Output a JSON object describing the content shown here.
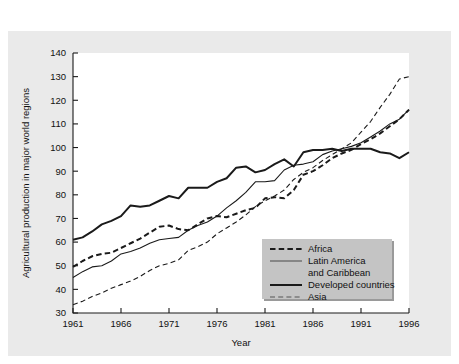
{
  "chart_data": {
    "type": "line",
    "title": "",
    "xlabel": "Year",
    "ylabel": "Agricultural production in major world regions",
    "xlim": [
      1961,
      1996
    ],
    "ylim": [
      30,
      140
    ],
    "xticks": [
      1961,
      1966,
      1971,
      1976,
      1981,
      1986,
      1991,
      1996
    ],
    "yticks": [
      30,
      40,
      50,
      60,
      70,
      80,
      90,
      100,
      110,
      120,
      130,
      140
    ],
    "grid": false,
    "legend_position": "bottom-right",
    "x": [
      1961,
      1962,
      1963,
      1964,
      1965,
      1966,
      1967,
      1968,
      1969,
      1970,
      1971,
      1972,
      1973,
      1974,
      1975,
      1976,
      1977,
      1978,
      1979,
      1980,
      1981,
      1982,
      1983,
      1984,
      1985,
      1986,
      1987,
      1988,
      1989,
      1990,
      1991,
      1992,
      1993,
      1994,
      1995,
      1996
    ],
    "series": [
      {
        "name": "Africa",
        "style": "bold-dashed",
        "color": "#1a1a1a",
        "values": [
          49.5,
          52.0,
          54.0,
          55.0,
          55.5,
          57.5,
          59.5,
          61.5,
          64.0,
          66.5,
          67.0,
          65.5,
          65.0,
          67.5,
          70.0,
          71.0,
          70.5,
          72.0,
          73.5,
          74.5,
          78.5,
          79.0,
          78.5,
          82.0,
          88.5,
          90.0,
          92.5,
          95.5,
          97.5,
          99.0,
          101.5,
          103.5,
          106.0,
          109.0,
          112.0,
          116.0
        ]
      },
      {
        "name": "Latin America and Caribbean",
        "style": "thin-solid",
        "color": "#555555",
        "values": [
          45.0,
          47.5,
          49.5,
          50.0,
          52.0,
          55.0,
          56.0,
          57.5,
          59.5,
          61.0,
          61.5,
          62.0,
          65.0,
          67.0,
          68.5,
          71.0,
          74.5,
          77.5,
          81.0,
          85.5,
          85.5,
          86.0,
          90.5,
          92.5,
          93.0,
          94.0,
          97.0,
          98.5,
          99.5,
          100.5,
          102.0,
          104.5,
          107.0,
          110.0,
          112.0,
          116.0
        ]
      },
      {
        "name": "Developed countries",
        "style": "bold-solid",
        "color": "#1a1a1a",
        "values": [
          61.0,
          62.0,
          64.5,
          67.5,
          69.0,
          71.0,
          75.5,
          75.0,
          75.5,
          77.5,
          79.5,
          78.5,
          83.0,
          83.0,
          83.0,
          85.5,
          87.0,
          91.5,
          92.0,
          89.5,
          90.5,
          93.0,
          95.0,
          92.0,
          98.0,
          99.0,
          99.0,
          99.5,
          98.5,
          99.5,
          99.5,
          99.5,
          98.0,
          97.5,
          95.5,
          98.0
        ]
      },
      {
        "name": "Asia",
        "style": "thin-dashed",
        "color": "#555555",
        "values": [
          33.5,
          35.0,
          37.0,
          38.5,
          40.5,
          42.0,
          43.5,
          45.5,
          48.0,
          50.0,
          51.0,
          52.5,
          56.5,
          58.0,
          60.0,
          63.5,
          66.0,
          68.5,
          71.5,
          75.0,
          77.5,
          79.5,
          82.0,
          86.5,
          89.5,
          91.5,
          94.5,
          97.0,
          99.5,
          102.0,
          106.5,
          111.0,
          117.0,
          122.5,
          129.0,
          130.0
        ]
      }
    ],
    "legend": [
      {
        "label": "Africa",
        "style": "bold-dashed"
      },
      {
        "label": "Latin America",
        "style": "thin-solid"
      },
      {
        "label": "and Caribbean",
        "style": "none"
      },
      {
        "label": "Developed countries",
        "style": "bold-solid"
      },
      {
        "label": "Asia",
        "style": "thin-dashed"
      }
    ]
  }
}
